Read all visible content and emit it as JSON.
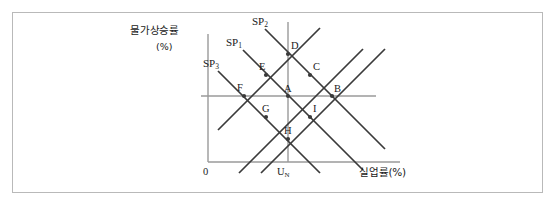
{
  "figure": {
    "type": "economics-diagram",
    "name": "expectations-augmented-phillips-curve"
  },
  "axes": {
    "y_title": "물가상승률",
    "y_unit": "(%)",
    "x_title": "실업률(%)",
    "origin_label": "0",
    "natural_rate_label": "U",
    "natural_rate_sub": "N"
  },
  "curves": [
    {
      "id": "sp3",
      "label": "SP",
      "sub": "3",
      "label_x": 203,
      "label_y": 58,
      "x1": 218,
      "y1": 71,
      "x2": 320,
      "y2": 173
    },
    {
      "id": "sp1",
      "label": "SP",
      "sub": "1",
      "label_x": 226,
      "label_y": 37,
      "x1": 243,
      "y1": 50,
      "x2": 363,
      "y2": 170
    },
    {
      "id": "sp2",
      "label": "SP",
      "sub": "2",
      "label_x": 252,
      "label_y": 16,
      "x1": 265,
      "y1": 29,
      "x2": 385,
      "y2": 149
    }
  ],
  "up_lines": [
    {
      "id": "up1",
      "x1": 218,
      "y1": 130,
      "x2": 320,
      "y2": 28
    },
    {
      "id": "up2",
      "x1": 239,
      "y1": 173,
      "x2": 363,
      "y2": 49
    },
    {
      "id": "up3",
      "x1": 261,
      "y1": 173,
      "x2": 385,
      "y2": 49
    }
  ],
  "points": [
    {
      "id": "D",
      "label": "D",
      "x": 288,
      "y": 54,
      "lx": 291,
      "ly": 41
    },
    {
      "id": "E",
      "label": "E",
      "x": 266,
      "y": 75,
      "lx": 259,
      "ly": 62
    },
    {
      "id": "C",
      "label": "C",
      "x": 310,
      "y": 75,
      "lx": 313,
      "ly": 62
    },
    {
      "id": "F",
      "label": "F",
      "x": 244,
      "y": 96,
      "lx": 237,
      "ly": 83
    },
    {
      "id": "A",
      "label": "A",
      "x": 288,
      "y": 96,
      "lx": 284,
      "ly": 84
    },
    {
      "id": "B",
      "label": "B",
      "x": 332,
      "y": 96,
      "lx": 334,
      "ly": 84
    },
    {
      "id": "G",
      "label": "G",
      "x": 266,
      "y": 117,
      "lx": 262,
      "ly": 104
    },
    {
      "id": "I",
      "label": "I",
      "x": 310,
      "y": 117,
      "lx": 313,
      "ly": 104
    },
    {
      "id": "H",
      "label": "H",
      "x": 288,
      "y": 139,
      "lx": 284,
      "ly": 126
    }
  ],
  "geometry": {
    "y_axis_x": 208,
    "y_axis_top": 34,
    "x_axis_y": 162,
    "x_axis_right": 400,
    "ref_line_y": 96,
    "ref_line_left": 201,
    "ref_line_right": 376,
    "un_line_x": 288,
    "un_line_top": 22,
    "un_line_bottom": 162
  },
  "colors": {
    "axis": "#9a9a9a",
    "curve": "#3a3a3a",
    "text": "#1a1a1a",
    "frame": "#b9b9b9",
    "background": "#ffffff"
  }
}
